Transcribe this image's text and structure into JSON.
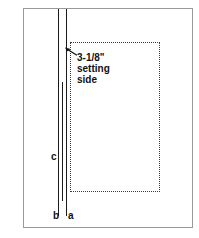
{
  "figure": {
    "page_outline": {
      "name": "sheet-outline"
    },
    "callout": {
      "lines": [
        "3-1/8\"",
        "setting",
        "side"
      ],
      "line1": "3-1/8\"",
      "line2": "setting",
      "line3": "side",
      "arrow_icon": "arrow-up-left-icon"
    },
    "labels": {
      "a": "a",
      "b": "b",
      "c": "c"
    },
    "colors": {
      "background": "#ffffff",
      "outline": "#9a9a9a",
      "line": "#1a1a1a",
      "dotted": "#3a3a3a",
      "text": "#111111"
    }
  }
}
